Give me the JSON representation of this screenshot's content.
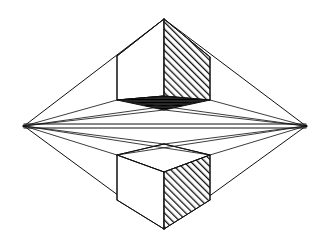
{
  "figure": {
    "background_color": "#ffffff",
    "line_color": "#101010",
    "hatch_color": "#101010",
    "canvas": {
      "width": 331,
      "height": 247
    }
  },
  "chart_data": {
    "type": "diagram",
    "xlabel": "",
    "ylabel": "",
    "xlim": [
      0,
      331
    ],
    "ylim": [
      0,
      247
    ],
    "grid": false,
    "legend": "none",
    "vanishing_points": [
      {
        "name": "left-vanishing-point",
        "x": 24,
        "y": 126
      },
      {
        "name": "right-vanishing-point",
        "x": 306,
        "y": 126
      }
    ],
    "horizon": {
      "y": 126,
      "x_start": 24,
      "x_end": 306
    },
    "key_points": [
      {
        "name": "upper-cube-front-top-corner",
        "x": 164,
        "y": 19
      },
      {
        "name": "upper-cube-front-bottom-corner",
        "x": 164,
        "y": 96
      },
      {
        "name": "upper-cube-right-back-top",
        "x": 210,
        "y": 57
      },
      {
        "name": "upper-cube-right-back-bottom",
        "x": 210,
        "y": 100
      },
      {
        "name": "upper-cube-left-back-top",
        "x": 117,
        "y": 56
      },
      {
        "name": "upper-cube-left-back-bottom",
        "x": 117,
        "y": 100
      },
      {
        "name": "lower-cube-front-top-corner",
        "x": 164,
        "y": 172
      },
      {
        "name": "lower-cube-front-bottom-corner",
        "x": 164,
        "y": 229
      },
      {
        "name": "lower-cube-right-back-top",
        "x": 210,
        "y": 155
      },
      {
        "name": "lower-cube-right-back-bottom",
        "x": 210,
        "y": 200
      },
      {
        "name": "lower-cube-left-back-top",
        "x": 117,
        "y": 155
      },
      {
        "name": "lower-cube-left-back-bottom",
        "x": 117,
        "y": 200
      }
    ],
    "series": [
      {
        "name": "upper-cube",
        "description": "Cube above the horizon, seen from below; right face hatched, underside dark",
        "faces": [
          {
            "face": "right",
            "fill": "diagonal-hatch"
          },
          {
            "face": "bottom",
            "fill": "dark"
          },
          {
            "face": "left",
            "fill": "white"
          }
        ]
      },
      {
        "name": "lower-cube",
        "description": "Cube below the horizon, seen from above; right face hatched, top face white",
        "faces": [
          {
            "face": "right",
            "fill": "diagonal-hatch"
          },
          {
            "face": "top",
            "fill": "white"
          },
          {
            "face": "left",
            "fill": "white"
          }
        ]
      },
      {
        "name": "convergence-rays",
        "description": "Construction lines running from every cube corner to the two vanishing points, producing the overall diamond silhouette"
      }
    ]
  }
}
